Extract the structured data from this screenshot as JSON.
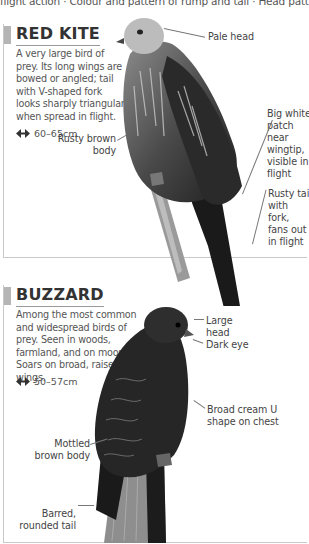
{
  "header": {
    "cutoff_text": "flight action · Colour and pattern of rump and tail · Head pattern"
  },
  "entries": [
    {
      "title": "RED KITE",
      "description": "A very large bird of prey. Its long wings are bowed or angled; tail with V-shaped fork looks sharply triangular when spread in flight.",
      "size_icon": "wingspan-arrows-icon",
      "size": "60–65cm",
      "annotations": [
        {
          "text": "Pale head"
        },
        {
          "text": "Rusty brown body"
        },
        {
          "text": "Big white patch near wingtip, visible in flight"
        },
        {
          "text": "Rusty tail with fork, fans out in flight"
        }
      ]
    },
    {
      "title": "BUZZARD",
      "description": "Among the most common and widespread birds of prey. Seen in woods, farmland, and on moors. Soars on broad, raised wings.",
      "size_icon": "wingspan-arrows-icon",
      "size": "50–57cm",
      "annotations": [
        {
          "text": "Large head"
        },
        {
          "text": "Dark eye"
        },
        {
          "text": "Mottled brown body"
        },
        {
          "text": "Broad cream U shape on chest"
        },
        {
          "text": "Barred, rounded tail"
        }
      ]
    }
  ],
  "colors": {
    "marker": "#b5b5b5",
    "border": "#c9c9c9",
    "title_text": "#333333",
    "body_text": "#555555"
  }
}
